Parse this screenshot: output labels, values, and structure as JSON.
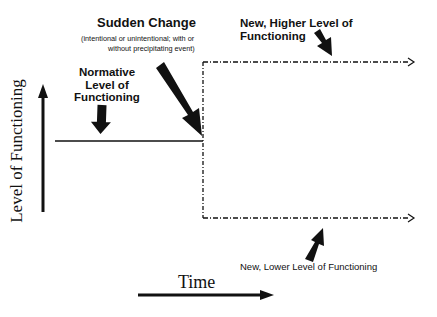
{
  "diagram": {
    "y_axis_label": "Level of Functioning",
    "x_axis_label": "Time",
    "sudden_change": {
      "title": "Sudden Change",
      "subtitle_line1": "(intentional or unintentional; with or",
      "subtitle_line2": "without precipitating event)"
    },
    "normative": {
      "line1": "Normative",
      "line2": "Level of",
      "line3": "Functioning"
    },
    "higher": {
      "line1": "New, Higher Level of",
      "line2": "Functioning"
    },
    "lower": {
      "label": "New, Lower Level of Functioning"
    },
    "colors": {
      "ink": "#111111",
      "background": "#ffffff"
    }
  }
}
